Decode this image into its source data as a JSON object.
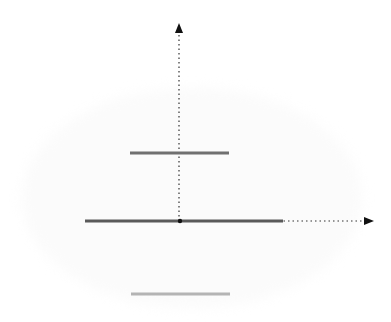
{
  "diagram": {
    "type": "energy-levels-on-axes",
    "axes": {
      "origin": [
        180,
        221
      ],
      "y_axis": {
        "x": 179,
        "y_top": 22,
        "style": "dotted",
        "arrow": "up"
      },
      "x_axis": {
        "y": 221,
        "x_end": 374,
        "style": "dotted",
        "arrow": "right"
      }
    },
    "segments": [
      {
        "name": "upper-level",
        "x1": 130,
        "x2": 229,
        "y": 153,
        "color": "#707070",
        "width": 3
      },
      {
        "name": "middle-level",
        "x1": 85,
        "x2": 283,
        "y": 221,
        "color": "#5a5a5a",
        "width": 3
      },
      {
        "name": "lower-level",
        "x1": 131,
        "x2": 230,
        "y": 294,
        "color": "#b4b4b4",
        "width": 3
      }
    ],
    "colors": {
      "axis": "#333333",
      "origin_dot": "#111111"
    }
  }
}
